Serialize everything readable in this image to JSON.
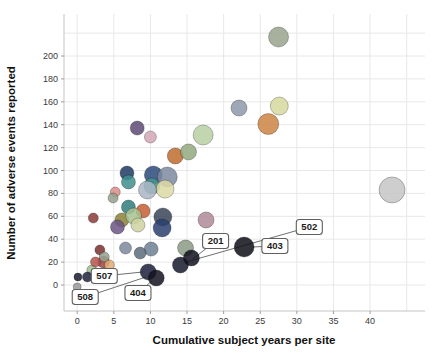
{
  "chart_data": {
    "type": "scatter",
    "subtype": "bubble",
    "title": "",
    "xlabel": "Cumulative subject years per site",
    "ylabel": "Number of adverse events reported",
    "x_ticks": [
      0,
      5,
      10,
      15,
      20,
      25,
      30,
      35,
      40
    ],
    "y_ticks": [
      0,
      20,
      40,
      60,
      80,
      100,
      120,
      140,
      160,
      180,
      200
    ],
    "xlim": [
      -1.8,
      47.5
    ],
    "ylim": [
      -22.7,
      236.7
    ],
    "grid": true,
    "legend": "none",
    "grid_color": "#e8e8e8",
    "axis_line_color": "#c4c4c4",
    "points": [
      {
        "x": 27.5,
        "y": 216.6,
        "r": 10,
        "color": "#99a38d"
      },
      {
        "x": 27.6,
        "y": 156.3,
        "r": 9,
        "color": "#d6d89e"
      },
      {
        "x": 26.1,
        "y": 140.6,
        "r": 10.5,
        "color": "#cd8443"
      },
      {
        "x": 22.1,
        "y": 154.6,
        "r": 8,
        "color": "#8d99a9"
      },
      {
        "x": 43.0,
        "y": 83.0,
        "r": 13,
        "color": "#c6c6c6"
      },
      {
        "x": 8.2,
        "y": 137.1,
        "r": 7,
        "color": "#5e4a75"
      },
      {
        "x": 10.0,
        "y": 129.3,
        "r": 6,
        "color": "#d2a8b6"
      },
      {
        "x": 17.2,
        "y": 131.0,
        "r": 10,
        "color": "#b7cfa2"
      },
      {
        "x": 13.4,
        "y": 112.7,
        "r": 8,
        "color": "#bf6b2e"
      },
      {
        "x": 15.2,
        "y": 116.2,
        "r": 8,
        "color": "#93a97f"
      },
      {
        "x": 6.8,
        "y": 97.8,
        "r": 7,
        "color": "#1f3864"
      },
      {
        "x": 7.0,
        "y": 90.0,
        "r": 7,
        "color": "#3f8e8e"
      },
      {
        "x": 10.4,
        "y": 96.1,
        "r": 9,
        "color": "#2d4a7a"
      },
      {
        "x": 10.2,
        "y": 86.5,
        "r": 8,
        "color": "#44958f"
      },
      {
        "x": 12.3,
        "y": 94.3,
        "r": 10,
        "color": "#7d8aa0"
      },
      {
        "x": 12.0,
        "y": 83.8,
        "r": 9,
        "color": "#ddd9a4"
      },
      {
        "x": 9.6,
        "y": 83.0,
        "r": 9,
        "color": "#aab6c4"
      },
      {
        "x": 5.2,
        "y": 81.2,
        "r": 5,
        "color": "#d98d86"
      },
      {
        "x": 4.9,
        "y": 76.0,
        "r": 5,
        "color": "#93a18c"
      },
      {
        "x": 2.2,
        "y": 58.5,
        "r": 5,
        "color": "#8b3a3a"
      },
      {
        "x": 6.1,
        "y": 56.8,
        "r": 7,
        "color": "#8a8136"
      },
      {
        "x": 5.5,
        "y": 50.7,
        "r": 7,
        "color": "#6a5584"
      },
      {
        "x": 7.0,
        "y": 68.1,
        "r": 7,
        "color": "#2f7d7d"
      },
      {
        "x": 9.0,
        "y": 64.6,
        "r": 7,
        "color": "#c65d33"
      },
      {
        "x": 7.7,
        "y": 60.3,
        "r": 8,
        "color": "#a8c290"
      },
      {
        "x": 8.3,
        "y": 52.4,
        "r": 7,
        "color": "#cfd2a0"
      },
      {
        "x": 11.7,
        "y": 59.4,
        "r": 9,
        "color": "#3a4458"
      },
      {
        "x": 11.6,
        "y": 49.8,
        "r": 9,
        "color": "#2a3f6e"
      },
      {
        "x": 17.6,
        "y": 56.8,
        "r": 8,
        "color": "#b08a9a"
      },
      {
        "x": 14.8,
        "y": 32.3,
        "r": 8,
        "color": "#8b9a84"
      },
      {
        "x": 10.1,
        "y": 31.4,
        "r": 7,
        "color": "#6f7f96"
      },
      {
        "x": 8.6,
        "y": 27.9,
        "r": 6,
        "color": "#5c6b7a"
      },
      {
        "x": 6.6,
        "y": 32.3,
        "r": 6,
        "color": "#7b8a9e"
      },
      {
        "x": 3.1,
        "y": 30.6,
        "r": 5,
        "color": "#7a2f2f"
      },
      {
        "x": 3.6,
        "y": 20.1,
        "r": 6,
        "color": "#9c4440"
      },
      {
        "x": 2.0,
        "y": 13.1,
        "r": 5,
        "color": "#9fbf8f"
      },
      {
        "x": 2.5,
        "y": 20.1,
        "r": 5,
        "color": "#b5534e"
      },
      {
        "x": 3.7,
        "y": 24.5,
        "r": 5,
        "color": "#96a190"
      },
      {
        "x": 4.4,
        "y": 17.5,
        "r": 5,
        "color": "#e0ab76"
      },
      {
        "x": 0.0,
        "y": -1.7,
        "r": 4,
        "color": "#9a9a9a"
      },
      {
        "x": 0.1,
        "y": 7.0,
        "r": 4,
        "color": "#1a1c2e"
      },
      {
        "x": 1.4,
        "y": 7.0,
        "r": 5,
        "color": "#20243c"
      },
      {
        "x": 9.7,
        "y": 11.4,
        "r": 8,
        "color": "#1b1f38"
      },
      {
        "x": 10.8,
        "y": 6.1,
        "r": 8,
        "color": "#12131f"
      },
      {
        "x": 14.1,
        "y": 17.5,
        "r": 8,
        "color": "#161a2c"
      },
      {
        "x": 15.6,
        "y": 23.6,
        "r": 8,
        "color": "#10121e"
      },
      {
        "x": 22.8,
        "y": 33.2,
        "r": 10,
        "color": "#0d0e18"
      }
    ],
    "callouts": [
      {
        "label": "508",
        "box": {
          "x": 1.1,
          "y": -10.5
        },
        "target": {
          "x": 9.4,
          "y": 7.0
        }
      },
      {
        "label": "507",
        "box": {
          "x": 3.7,
          "y": 7.9
        },
        "target": {
          "x": 9.0,
          "y": 11.4
        }
      },
      {
        "label": "404",
        "box": {
          "x": 8.3,
          "y": -7.0
        },
        "target": {
          "x": 10.2,
          "y": 3.5
        }
      },
      {
        "label": "201",
        "box": {
          "x": 18.9,
          "y": 38.4
        },
        "target": {
          "x": 15.8,
          "y": 22.7
        }
      },
      {
        "label": "403",
        "box": {
          "x": 27.0,
          "y": 34.1
        },
        "target": {
          "x": 24.0,
          "y": 33.2
        }
      },
      {
        "label": "502",
        "box": {
          "x": 31.7,
          "y": 50.7
        },
        "target": {
          "x": 14.9,
          "y": 20.1
        }
      }
    ],
    "callout_style": {
      "fill": "#ffffff",
      "border": "#5f5f5f",
      "leader": "#707070"
    }
  }
}
